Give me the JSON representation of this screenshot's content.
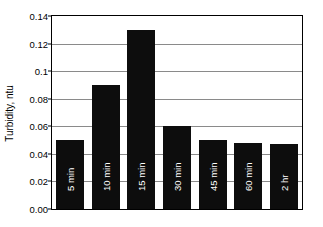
{
  "chart_data": {
    "type": "bar",
    "title": "",
    "subtitle": "",
    "xlabel": "",
    "ylabel": "Turbidity, ntu",
    "categories": [
      "5 min",
      "10 min",
      "15 min",
      "30 min",
      "45 min",
      "60 min",
      "2 hr"
    ],
    "values": [
      0.05,
      0.09,
      0.13,
      0.06,
      0.05,
      0.048,
      0.047
    ],
    "series": [
      {
        "name": "Turbidity",
        "values": [
          0.05,
          0.09,
          0.13,
          0.06,
          0.05,
          0.048,
          0.047
        ]
      }
    ],
    "ylim": [
      0.0,
      0.14
    ],
    "ytick_values": [
      0.0,
      0.02,
      0.04,
      0.06,
      0.08,
      0.1,
      0.12,
      0.14
    ],
    "ytick_labels": [
      "0.00",
      "0.02",
      "0.04",
      "0.06",
      "0.08",
      "0.1",
      "0.12",
      "0.14"
    ],
    "grid": true,
    "grid_axis": "y",
    "legend": false,
    "legend_position": "none",
    "bar_color": "#0d0d0d",
    "bar_label_color": "#ffffff",
    "gridline_color": "#8a8a8a",
    "axis_color": "#000000",
    "background_color": "#ffffff",
    "bar_labels_inside": true,
    "bar_label_rotation": -90
  }
}
